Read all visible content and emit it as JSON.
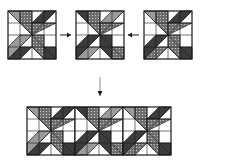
{
  "diagram": {
    "colors": {
      "background": "#ffffff",
      "outline": "#1a1a1a",
      "dark": "#3c3c3c",
      "medium": "#9a9a9a",
      "print": "#6e6e6e",
      "print_dot": "#d8d8d8",
      "white": "#ffffff",
      "arrow": "#1a1a1a",
      "arrow_shaft": "#8a8a8a"
    },
    "blocks": [
      {
        "id": "block-1",
        "x": 8,
        "y": 11,
        "size": 48,
        "variant": [
          "medium",
          "print",
          "dark",
          "print",
          "dark",
          "print",
          "dark",
          "medium"
        ]
      },
      {
        "id": "block-2",
        "x": 76,
        "y": 11,
        "size": 48,
        "variant": [
          "dark",
          "print",
          "medium",
          "print",
          "print",
          "dark",
          "medium",
          "dark"
        ]
      },
      {
        "id": "block-3",
        "x": 144,
        "y": 11,
        "size": 48,
        "variant": [
          "medium",
          "print",
          "dark",
          "print",
          "dark",
          "print",
          "print",
          "dark"
        ]
      }
    ],
    "row": {
      "x": 27,
      "y": 107,
      "block_size": 48,
      "blocks": [
        [
          "medium",
          "print",
          "dark",
          "print",
          "dark",
          "print",
          "dark",
          "medium"
        ],
        [
          "dark",
          "print",
          "medium",
          "print",
          "print",
          "dark",
          "medium",
          "dark"
        ],
        [
          "medium",
          "print",
          "dark",
          "print",
          "dark",
          "print",
          "print",
          "dark"
        ]
      ]
    },
    "arrows": [
      {
        "id": "arrow-right",
        "direction": "right",
        "x1": 60,
        "y1": 35,
        "x2": 71,
        "y2": 35
      },
      {
        "id": "arrow-left",
        "direction": "left",
        "x1": 139,
        "y1": 35,
        "x2": 128,
        "y2": 35
      },
      {
        "id": "arrow-down",
        "direction": "down",
        "x1": 100,
        "y1": 77,
        "x2": 100,
        "y2": 96
      }
    ]
  }
}
